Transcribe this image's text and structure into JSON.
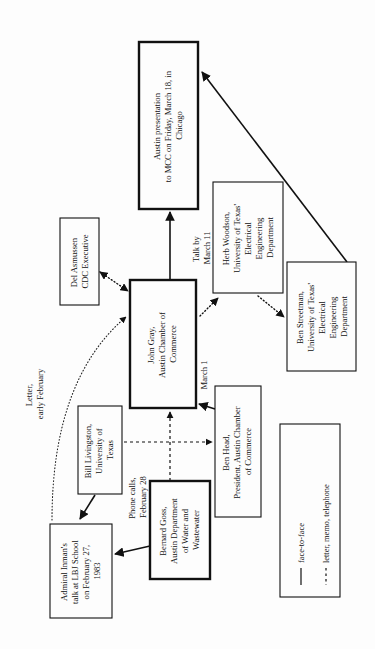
{
  "diagram": {
    "orientation": "rotated 90deg counter-clockwise",
    "colors": {
      "ink": "#111111",
      "background": "#fdfdfd"
    },
    "nodes": {
      "presentation": {
        "lines": [
          "Austin  presentation",
          "to MCC on Friday, March 18, in",
          "Chicago"
        ],
        "emphasis": "thick"
      },
      "herb_woodson": {
        "lines": [
          "Herb  Woodson,",
          "University of Texas'",
          "Electrical",
          "Engineering",
          "Department"
        ]
      },
      "ben_streetman": {
        "lines": [
          "Ben  Streetman,",
          "University of Texas'",
          "Electrical",
          "Engineering",
          "Department"
        ]
      },
      "del_asmussen": {
        "lines": [
          "Del Asmussen",
          "CDC Executive"
        ]
      },
      "john_gray": {
        "lines": [
          "John Gray,",
          "Austin Chamber of",
          "Commerce"
        ],
        "emphasis": "thick"
      },
      "ben_head": {
        "lines": [
          "Ben Head,",
          "President, Austin Chamber",
          "of Commerce"
        ]
      },
      "bill_livingston": {
        "lines": [
          "Bill  Livingston,",
          "University of",
          "Texas"
        ]
      },
      "bernard_goss": {
        "lines": [
          "Bernard Goss,",
          "Austin Department",
          "of Water and",
          "Wastewater"
        ],
        "emphasis": "thick"
      },
      "admiral_inman": {
        "lines": [
          "Admiral Inman's",
          "talk at LBJ School",
          "on February 27,",
          "1983"
        ]
      }
    },
    "edge_labels": {
      "talk_by": [
        "Talk by",
        "March 11"
      ],
      "march_1": [
        "March 1"
      ],
      "phone_calls": [
        "Phone  calls,",
        "February 28"
      ],
      "letter": [
        "Letter,",
        "early February"
      ]
    },
    "legend": {
      "items": [
        {
          "style": "solid",
          "label": "face-to-face"
        },
        {
          "style": "dashed",
          "label": "letter, memo, telephone"
        }
      ]
    }
  }
}
